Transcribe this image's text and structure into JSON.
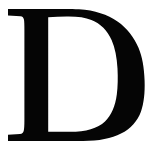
{
  "image": {
    "kind": "glyph-image",
    "description": "Scanned serif capital letter",
    "width": 147,
    "height": 150
  },
  "glyph": {
    "character": "D",
    "name": "latin-capital-letter-d",
    "style": "serif",
    "weight": "regular",
    "color": "#050505",
    "background_color": "#ffffff",
    "alt_text": "D"
  },
  "metrics": {
    "cap_top_y": 9,
    "baseline_y": 141,
    "left_serif_x": 8,
    "right_bowl_x": 143,
    "stem_left_x": 20,
    "stem_right_x": 48,
    "counter_left_x": 48,
    "counter_right_x": 112
  }
}
